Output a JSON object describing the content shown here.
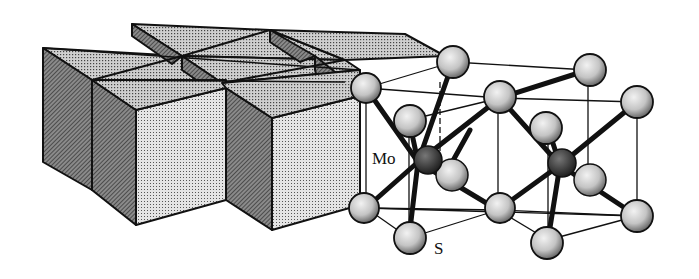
{
  "figure": {
    "left_panel": "trigonal prism polyhedral representation",
    "right_panel": "ball-and-stick unit cell",
    "labels": {
      "mo": "Mo",
      "s": "S"
    },
    "colors": {
      "prism_top": "#c9c9c9",
      "prism_front": "#dcdcdc",
      "prism_side_dark": "#6e6e6e",
      "prism_side_mid": "#9a9a9a",
      "edge": "#111111",
      "s_atom": "#d2d2d2",
      "mo_atom": "#3a3a3a",
      "bond": "#111111"
    }
  }
}
